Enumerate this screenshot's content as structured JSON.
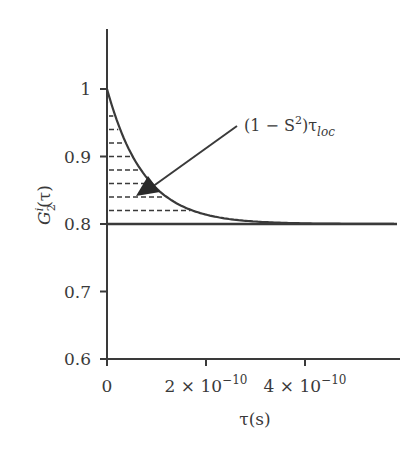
{
  "chart_data": {
    "type": "line",
    "title": "",
    "xlabel": "τ(s)",
    "ylabel": "G₂ⁱ(τ)",
    "ylabel_parts": {
      "base": "G",
      "sub": "2",
      "sup": "i",
      "arg": "(τ)"
    },
    "xlim": [
      0,
      5.8e-10
    ],
    "ylim": [
      0.6,
      1.08
    ],
    "x_ticks": [
      {
        "value": 0,
        "label": "0"
      },
      {
        "value": 2e-10,
        "label": "2 × 10",
        "exp": "−10"
      },
      {
        "value": 4e-10,
        "label": "4 × 10",
        "exp": "−10"
      }
    ],
    "y_ticks": [
      {
        "value": 1.0,
        "label": "1"
      },
      {
        "value": 0.9,
        "label": "0.9"
      },
      {
        "value": 0.8,
        "label": "0.8"
      },
      {
        "value": 0.7,
        "label": "0.7"
      },
      {
        "value": 0.6,
        "label": "0.6"
      }
    ],
    "grid": false,
    "series": [
      {
        "name": "G2i(tau) exponential decay",
        "style": "solid",
        "x": [
          0,
          2.5e-11,
          5e-11,
          7.5e-11,
          1e-10,
          1.5e-10,
          2e-10,
          2.5e-10,
          3e-10,
          4e-10,
          5e-10,
          5.8e-10
        ],
        "y": [
          1.0,
          0.95,
          0.912,
          0.884,
          0.862,
          0.836,
          0.821,
          0.812,
          0.807,
          0.802,
          0.8005,
          0.8
        ]
      },
      {
        "name": "plateau S^2",
        "style": "solid-horizontal",
        "x": [
          0,
          5.8e-10
        ],
        "y": [
          0.8,
          0.8
        ]
      }
    ],
    "shaded_area": {
      "description": "dashed horizontal hatching between the curve and the 0.8 plateau",
      "hatch_levels": [
        0.98,
        0.96,
        0.94,
        0.92,
        0.9,
        0.88,
        0.86,
        0.84,
        0.82
      ]
    },
    "annotations": [
      {
        "text": "(1 − S²)τ_loc",
        "main": "(1 − S",
        "sup": "2",
        "mid": ")τ",
        "sub": "loc",
        "arrow_to_area": true
      }
    ]
  }
}
